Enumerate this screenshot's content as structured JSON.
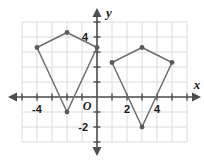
{
  "chart_data": {
    "type": "scatter",
    "title": "",
    "xlabel": "x",
    "ylabel": "y",
    "origin_label": "O",
    "grid": true,
    "legend": "none",
    "xlim": [
      -5,
      6
    ],
    "ylim": [
      -3,
      5
    ],
    "x_ticks": [
      -4,
      2,
      4
    ],
    "x_tick_labels": [
      "-4",
      "2",
      "4"
    ],
    "y_ticks": [
      4,
      -2
    ],
    "y_tick_labels": [
      "4",
      "-2"
    ],
    "tick_interval": 1,
    "colors": {
      "grid": "#dcdcdc",
      "axis": "#4d4d4d",
      "shape_stroke": "#6e6e6e",
      "vertex_fill": "#5a5a5a",
      "background": "#ffffff"
    },
    "series": [
      {
        "name": "left-quadrilateral",
        "closed": true,
        "points": [
          {
            "x": -4,
            "y": 3.3
          },
          {
            "x": -2,
            "y": 4.3
          },
          {
            "x": 0,
            "y": 3.3
          },
          {
            "x": -2,
            "y": -1
          }
        ]
      },
      {
        "name": "right-quadrilateral",
        "closed": true,
        "points": [
          {
            "x": 1,
            "y": 2.3
          },
          {
            "x": 3,
            "y": 3.3
          },
          {
            "x": 5,
            "y": 2.3
          },
          {
            "x": 3,
            "y": -2
          }
        ]
      }
    ]
  }
}
